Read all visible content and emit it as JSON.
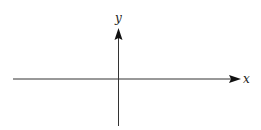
{
  "diagram": {
    "type": "cartesian-axes",
    "x_axis": {
      "label": "x",
      "direction": "right"
    },
    "y_axis": {
      "label": "y",
      "direction": "up"
    },
    "colors": {
      "axis": "#222222",
      "background": "#ffffff"
    }
  }
}
